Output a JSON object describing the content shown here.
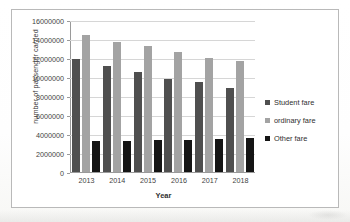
{
  "chart_data": {
    "type": "bar",
    "title": "",
    "xlabel": "Year",
    "ylabel": "number of passenger carried",
    "categories": [
      "2013",
      "2014",
      "2015",
      "2016",
      "2017",
      "2018"
    ],
    "series": [
      {
        "name": "Student fare",
        "color": "#4f4f4f",
        "values": [
          12000000,
          11250000,
          10650000,
          9900000,
          9500000,
          8900000
        ]
      },
      {
        "name": "ordinary fare",
        "color": "#a3a3a3",
        "values": [
          14500000,
          13750000,
          13300000,
          12700000,
          12100000,
          11750000
        ]
      },
      {
        "name": "Other fare",
        "color": "#151515",
        "values": [
          3300000,
          3300000,
          3350000,
          3400000,
          3500000,
          3600000
        ]
      }
    ],
    "ylim": [
      0,
      16000000
    ],
    "ytick_labels": [
      "16000000",
      "14000000",
      "12000000",
      "10000000",
      "8000000",
      "6000000",
      "4000000",
      "2000000",
      "0"
    ],
    "ytick_values": [
      16000000,
      14000000,
      12000000,
      10000000,
      8000000,
      6000000,
      4000000,
      2000000,
      0
    ],
    "grid": true,
    "legend_position": "right"
  }
}
